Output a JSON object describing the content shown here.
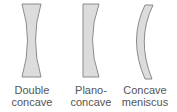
{
  "diagram": {
    "lenses": [
      {
        "name": "double-concave",
        "label_line1": "Double",
        "label_line2": "concave"
      },
      {
        "name": "plano-concave",
        "label_line1": "Plano-",
        "label_line2": "concave"
      },
      {
        "name": "concave-meniscus",
        "label_line1": "Concave",
        "label_line2": "meniscus"
      }
    ],
    "colors": {
      "fill": "#dcdcdc",
      "stroke": "#8a8a8a",
      "text": "#555555"
    }
  }
}
